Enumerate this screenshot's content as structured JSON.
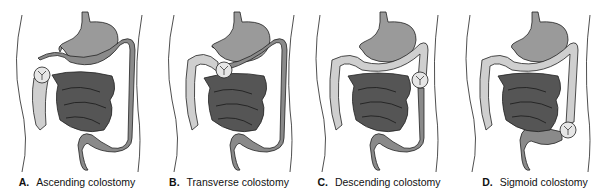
{
  "figure": {
    "panels": [
      {
        "letter": "A.",
        "label": "Ascending colostomy",
        "stoma_site": "ascending"
      },
      {
        "letter": "B.",
        "label": "Transverse colostomy",
        "stoma_site": "transverse"
      },
      {
        "letter": "C.",
        "label": "Descending colostomy",
        "stoma_site": "descending"
      },
      {
        "letter": "D.",
        "label": "Sigmoid colostomy",
        "stoma_site": "sigmoid"
      }
    ],
    "colors": {
      "active_bowel": "#8a8a8a",
      "inactive_bowel": "#cfcfcf",
      "small_intestine": "#555555",
      "stomach": "#9a9a9a",
      "outline": "#222222",
      "stoma": "#e6e6e6"
    }
  }
}
